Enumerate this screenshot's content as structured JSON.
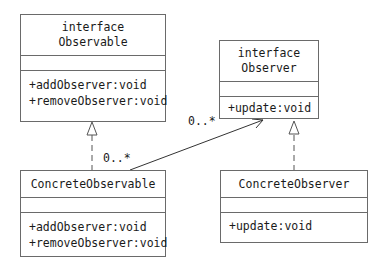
{
  "classes": {
    "observable": {
      "stereotype": "interface",
      "name": "Observable",
      "operations": [
        "+addObserver:void",
        "+removeObserver:void"
      ]
    },
    "observer": {
      "stereotype": "interface",
      "name": "Observer",
      "operations": [
        "+update:void"
      ]
    },
    "concrete_observable": {
      "name": "ConcreteObservable",
      "operations": [
        "+addObserver:void",
        "+removeObserver:void"
      ]
    },
    "concrete_observer": {
      "name": "ConcreteObserver",
      "operations": [
        "+update:void"
      ]
    }
  },
  "relations": {
    "association": {
      "from": "ConcreteObservable",
      "to": "Observer",
      "source_multiplicity": "0..*",
      "target_multiplicity": "0..*"
    },
    "realizations": [
      {
        "from": "ConcreteObservable",
        "to": "Observable"
      },
      {
        "from": "ConcreteObserver",
        "to": "Observer"
      }
    ]
  }
}
